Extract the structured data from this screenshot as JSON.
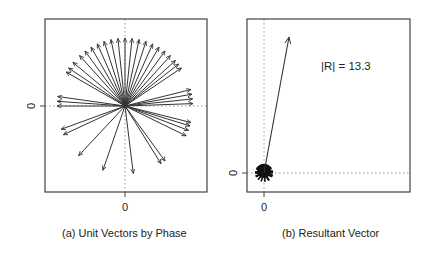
{
  "figure": {
    "panel_a": {
      "caption": "(a) Unit Vectors by Phase",
      "x_tick": "0",
      "y_tick": "0"
    },
    "panel_b": {
      "caption": "(b) Resultant Vector",
      "x_tick": "0",
      "y_tick": "0",
      "annotation": "|R| = 13.3"
    },
    "colors": {
      "arrow": "#333333",
      "axis": "#555555",
      "guide": "#999999"
    }
  },
  "chart_data": [
    {
      "type": "scatter",
      "title": "(a) Unit Vectors by Phase",
      "xlabel": "",
      "ylabel": "",
      "x_ticks": [
        "0"
      ],
      "y_ticks": [
        "0"
      ],
      "xlim": [
        -1.2,
        1.2
      ],
      "ylim": [
        -1.3,
        1.3
      ],
      "grid": false,
      "guides": "dotted lines at x=0 and y=0",
      "description": "Unit vectors from the origin, angles in degrees measured from +x axis",
      "angles_deg": [
        2,
        6,
        10,
        14,
        34,
        38,
        42,
        48,
        54,
        60,
        66,
        72,
        78,
        84,
        90,
        96,
        102,
        108,
        114,
        120,
        126,
        132,
        140,
        146,
        150,
        172,
        176,
        180,
        200,
        205,
        227,
        251,
        277,
        302,
        306,
        334,
        339,
        343,
        346
      ],
      "magnitude": 1
    },
    {
      "type": "scatter",
      "title": "(b) Resultant Vector",
      "xlabel": "",
      "ylabel": "",
      "x_ticks": [
        "0"
      ],
      "y_ticks": [
        "0"
      ],
      "grid": false,
      "guides": "dotted lines at x=0 and y=0",
      "resultant": {
        "magnitude": 13.3,
        "angle_deg": 80,
        "x": 2.3,
        "y": 13.1
      },
      "annotation": "|R| = 13.3",
      "description": "Resultant vector from the origin; the small unit-vector fan is drawn at the origin to scale"
    }
  ]
}
